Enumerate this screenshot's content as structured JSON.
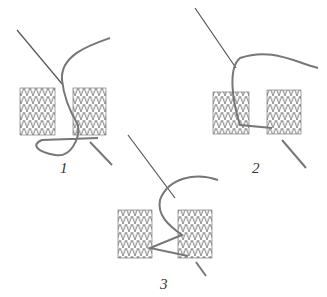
{
  "figure": {
    "panels": [
      {
        "label": "1",
        "x": 64,
        "y": 180
      },
      {
        "label": "2",
        "x": 250,
        "y": 166
      },
      {
        "label": "3",
        "x": 160,
        "y": 280
      }
    ],
    "colors": {
      "ink": "#555555",
      "yarn": "#777777",
      "background": "#ffffff"
    }
  }
}
